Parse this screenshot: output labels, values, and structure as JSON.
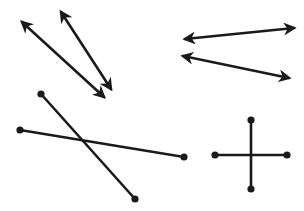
{
  "diagram": {
    "width": 304,
    "height": 211,
    "background": "#ffffff",
    "stroke_color": "#1a1a1a",
    "groups": [
      {
        "name": "lines-top-left",
        "kind": "lines-with-arrows-both-ends",
        "items": [
          {
            "x1": 22,
            "y1": 22,
            "x2": 104,
            "y2": 97
          },
          {
            "x1": 61,
            "y1": 12,
            "x2": 111,
            "y2": 89
          }
        ]
      },
      {
        "name": "lines-top-right",
        "kind": "lines-with-arrows-both-ends",
        "items": [
          {
            "x1": 185,
            "y1": 39,
            "x2": 294,
            "y2": 28
          },
          {
            "x1": 183,
            "y1": 56,
            "x2": 289,
            "y2": 78
          }
        ]
      },
      {
        "name": "segments-bottom-left",
        "kind": "segments-with-endpoints",
        "items": [
          {
            "x1": 41,
            "y1": 94,
            "x2": 135,
            "y2": 199
          },
          {
            "x1": 20,
            "y1": 130,
            "x2": 184,
            "y2": 157
          }
        ]
      },
      {
        "name": "segments-bottom-right",
        "kind": "segments-with-endpoints",
        "items": [
          {
            "x1": 251,
            "y1": 120,
            "x2": 251,
            "y2": 189
          },
          {
            "x1": 215,
            "y1": 155,
            "x2": 287,
            "y2": 155
          }
        ]
      }
    ]
  }
}
